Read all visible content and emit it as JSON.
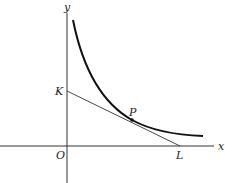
{
  "diagram": {
    "type": "geometry-figure",
    "labels": {
      "y_axis": "y",
      "x_axis": "x",
      "origin": "O",
      "point_k": "K",
      "point_p": "P",
      "point_l": "L"
    },
    "colors": {
      "background": "#ffffff",
      "axes": "#333333",
      "curve": "#111111",
      "tangent": "#333333",
      "text": "#222222"
    }
  }
}
